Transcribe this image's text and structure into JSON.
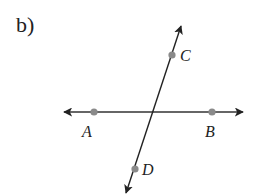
{
  "part": {
    "label": "b)"
  },
  "figure": {
    "line_color": "#222222",
    "point_color": "#8a8a8a",
    "lines": [
      {
        "name": "line-AB",
        "from": [
          64,
          112
        ],
        "to": [
          243,
          112
        ],
        "arrows": "both"
      },
      {
        "name": "line-CD",
        "from": [
          181,
          26
        ],
        "to": [
          126,
          193
        ],
        "arrows": "both"
      }
    ],
    "points": [
      {
        "id": "A",
        "label": "A",
        "x": 94,
        "y": 112,
        "label_x": 82,
        "label_y": 137
      },
      {
        "id": "B",
        "label": "B",
        "x": 212,
        "y": 112,
        "label_x": 205,
        "label_y": 137
      },
      {
        "id": "C",
        "label": "C",
        "x": 172,
        "y": 55,
        "label_x": 180,
        "label_y": 60
      },
      {
        "id": "D",
        "label": "D",
        "x": 135,
        "y": 169,
        "label_x": 142,
        "label_y": 175
      }
    ],
    "intersection": {
      "x": 153,
      "y": 112
    }
  }
}
